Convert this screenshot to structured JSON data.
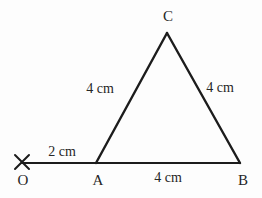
{
  "figure": {
    "canvas": {
      "width": 262,
      "height": 198
    },
    "background_color": "#fdfdfd",
    "stroke_color": "#1c1c1c",
    "text_color": "#262626",
    "base_line_width": 2.2,
    "side_line_width": 2.4,
    "mark_line_width": 2.0
  },
  "points": {
    "O": {
      "label": "O",
      "x": 22,
      "y": 163,
      "label_x": 23,
      "label_y": 180,
      "marker": "x-cross-mark"
    },
    "A": {
      "label": "A",
      "x": 96,
      "y": 163,
      "label_x": 98,
      "label_y": 180
    },
    "B": {
      "label": "B",
      "x": 240,
      "y": 163,
      "label_x": 243,
      "label_y": 180
    },
    "C": {
      "label": "C",
      "x": 167,
      "y": 33,
      "label_x": 168,
      "label_y": 16
    }
  },
  "segments": [
    {
      "name": "segment-OA",
      "from": "O",
      "to": "A",
      "x1": 22,
      "y1": 163,
      "x2": 96,
      "y2": 163
    },
    {
      "name": "segment-AB",
      "from": "A",
      "to": "B",
      "x1": 96,
      "y1": 163,
      "x2": 240,
      "y2": 163
    },
    {
      "name": "segment-AC",
      "from": "A",
      "to": "C",
      "x1": 96,
      "y1": 163,
      "x2": 167,
      "y2": 33
    },
    {
      "name": "segment-CB",
      "from": "C",
      "to": "B",
      "x1": 167,
      "y1": 33,
      "x2": 240,
      "y2": 163
    }
  ],
  "marker": {
    "name": "x-cross-mark",
    "center_x": 22,
    "center_y": 162,
    "half_size": 7
  },
  "measurements": {
    "OA": {
      "text": "2 cm",
      "x": 62,
      "y": 152
    },
    "AC": {
      "text": "4 cm",
      "x": 100,
      "y": 89
    },
    "CB": {
      "text": "4 cm",
      "x": 220,
      "y": 88
    },
    "AB": {
      "text": "4 cm",
      "x": 168,
      "y": 178
    }
  }
}
